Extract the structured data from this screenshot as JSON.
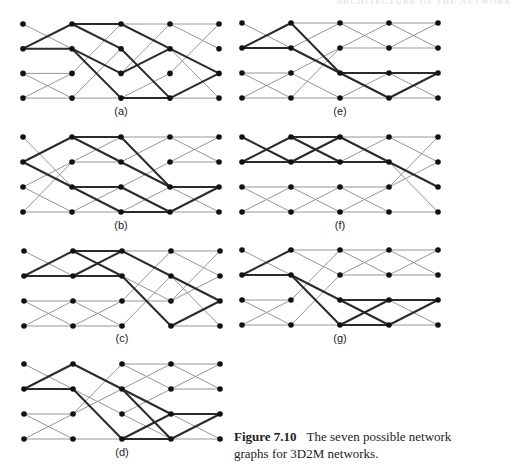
{
  "header": {
    "text": "ARCHITECTURE OF THE NETWORK"
  },
  "caption": {
    "figure_number": "Figure 7.10",
    "text": "The seven possible network graphs for 3D2M networks."
  },
  "style": {
    "node_color": "#111111",
    "thin_color": "#8a8a8a",
    "thick_color": "#2a2a2a"
  },
  "panels": [
    {
      "label": "(a)",
      "x0": 23,
      "y0": 24,
      "dx": 49,
      "dy": 24.7,
      "label_y": 115,
      "thin": [
        [
          0,
          0,
          0,
          0
        ],
        [
          0,
          0,
          1,
          1
        ],
        [
          0,
          2,
          1,
          2
        ],
        [
          0,
          2,
          1,
          3
        ],
        [
          0,
          3,
          1,
          2
        ],
        [
          0,
          3,
          1,
          3
        ],
        [
          1,
          2,
          2,
          0
        ],
        [
          1,
          3,
          2,
          1
        ],
        [
          1,
          3,
          2,
          3
        ],
        [
          2,
          0,
          3,
          0
        ],
        [
          2,
          2,
          3,
          0
        ],
        [
          2,
          3,
          3,
          2
        ],
        [
          3,
          0,
          4,
          0
        ],
        [
          3,
          0,
          4,
          1
        ],
        [
          3,
          1,
          4,
          3
        ],
        [
          3,
          2,
          4,
          0
        ],
        [
          3,
          3,
          4,
          3
        ]
      ],
      "thick": [
        [
          0,
          1,
          1,
          0
        ],
        [
          0,
          1,
          1,
          1
        ],
        [
          1,
          0,
          2,
          0
        ],
        [
          1,
          0,
          2,
          1
        ],
        [
          1,
          1,
          2,
          2
        ],
        [
          1,
          1,
          2,
          3
        ],
        [
          2,
          0,
          3,
          1
        ],
        [
          2,
          1,
          3,
          3
        ],
        [
          2,
          2,
          3,
          1
        ],
        [
          2,
          3,
          3,
          3
        ],
        [
          3,
          1,
          4,
          2
        ],
        [
          3,
          3,
          4,
          2
        ]
      ]
    },
    {
      "label": "(e)",
      "x0": 242,
      "y0": 23,
      "dx": 49,
      "dy": 25,
      "label_y": 115,
      "thin": [
        [
          0,
          0,
          0,
          0
        ],
        [
          0,
          0,
          1,
          1
        ],
        [
          0,
          2,
          1,
          2
        ],
        [
          0,
          2,
          1,
          3
        ],
        [
          0,
          3,
          1,
          2
        ],
        [
          0,
          3,
          1,
          3
        ],
        [
          1,
          0,
          2,
          0
        ],
        [
          1,
          1,
          2,
          0
        ],
        [
          1,
          2,
          2,
          1
        ],
        [
          1,
          3,
          2,
          3
        ],
        [
          1,
          3,
          2,
          1
        ],
        [
          1,
          2,
          2,
          3
        ],
        [
          2,
          0,
          3,
          0
        ],
        [
          2,
          0,
          3,
          1
        ],
        [
          2,
          1,
          3,
          1
        ],
        [
          2,
          1,
          3,
          0
        ],
        [
          2,
          2,
          3,
          2
        ],
        [
          2,
          3,
          3,
          2
        ],
        [
          2,
          3,
          3,
          3
        ],
        [
          3,
          0,
          4,
          0
        ],
        [
          3,
          0,
          4,
          1
        ],
        [
          3,
          1,
          4,
          1
        ],
        [
          3,
          1,
          4,
          0
        ],
        [
          3,
          2,
          4,
          3
        ],
        [
          3,
          3,
          4,
          3
        ]
      ],
      "thick": [
        [
          0,
          1,
          1,
          0
        ],
        [
          0,
          1,
          1,
          1
        ],
        [
          1,
          0,
          2,
          2
        ],
        [
          1,
          1,
          2,
          2
        ],
        [
          2,
          2,
          3,
          2
        ],
        [
          2,
          2,
          3,
          3
        ],
        [
          3,
          2,
          4,
          2
        ],
        [
          3,
          3,
          4,
          2
        ]
      ]
    },
    {
      "label": "(b)",
      "x0": 23,
      "y0": 137,
      "dx": 49,
      "dy": 25,
      "label_y": 229,
      "thin": [
        [
          0,
          0,
          0,
          0
        ],
        [
          0,
          0,
          1,
          2
        ],
        [
          0,
          2,
          1,
          1
        ],
        [
          0,
          2,
          1,
          3
        ],
        [
          0,
          3,
          1,
          1
        ],
        [
          0,
          3,
          1,
          3
        ],
        [
          1,
          1,
          2,
          1
        ],
        [
          1,
          1,
          2,
          0
        ],
        [
          1,
          3,
          2,
          2
        ],
        [
          1,
          3,
          2,
          3
        ],
        [
          2,
          0,
          3,
          0
        ],
        [
          2,
          1,
          3,
          0
        ],
        [
          2,
          2,
          3,
          1
        ],
        [
          2,
          3,
          3,
          2
        ],
        [
          3,
          0,
          4,
          0
        ],
        [
          3,
          0,
          4,
          1
        ],
        [
          3,
          1,
          4,
          0
        ],
        [
          3,
          1,
          4,
          1
        ],
        [
          3,
          2,
          4,
          3
        ],
        [
          3,
          3,
          4,
          3
        ]
      ],
      "thick": [
        [
          0,
          1,
          1,
          0
        ],
        [
          0,
          1,
          1,
          2
        ],
        [
          1,
          0,
          2,
          0
        ],
        [
          1,
          0,
          2,
          1
        ],
        [
          1,
          2,
          2,
          2
        ],
        [
          1,
          2,
          2,
          3
        ],
        [
          2,
          0,
          3,
          2
        ],
        [
          2,
          1,
          3,
          2
        ],
        [
          2,
          2,
          3,
          3
        ],
        [
          2,
          3,
          3,
          3
        ],
        [
          3,
          2,
          4,
          2
        ],
        [
          3,
          3,
          4,
          2
        ]
      ]
    },
    {
      "label": "(f)",
      "x0": 242,
      "y0": 137,
      "dx": 49,
      "dy": 25,
      "label_y": 229,
      "thin": [
        [
          0,
          0,
          0,
          0
        ],
        [
          0,
          2,
          1,
          2
        ],
        [
          0,
          2,
          1,
          3
        ],
        [
          0,
          3,
          1,
          2
        ],
        [
          0,
          3,
          1,
          3
        ],
        [
          1,
          2,
          2,
          2
        ],
        [
          1,
          2,
          2,
          3
        ],
        [
          1,
          3,
          2,
          2
        ],
        [
          1,
          3,
          2,
          3
        ],
        [
          2,
          0,
          3,
          0
        ],
        [
          2,
          1,
          3,
          0
        ],
        [
          2,
          2,
          3,
          2
        ],
        [
          2,
          2,
          3,
          3
        ],
        [
          2,
          3,
          3,
          2
        ],
        [
          2,
          3,
          3,
          3
        ],
        [
          3,
          0,
          4,
          0
        ],
        [
          3,
          0,
          4,
          1
        ],
        [
          3,
          1,
          4,
          3
        ],
        [
          3,
          2,
          4,
          0
        ],
        [
          3,
          2,
          4,
          1
        ],
        [
          3,
          3,
          4,
          3
        ]
      ],
      "thick": [
        [
          0,
          1,
          1,
          0
        ],
        [
          0,
          1,
          1,
          1
        ],
        [
          0,
          0,
          1,
          1
        ],
        [
          1,
          0,
          2,
          0
        ],
        [
          1,
          0,
          2,
          1
        ],
        [
          1,
          1,
          2,
          0
        ],
        [
          1,
          1,
          2,
          1
        ],
        [
          2,
          0,
          3,
          1
        ],
        [
          2,
          1,
          3,
          1
        ],
        [
          3,
          1,
          4,
          2
        ]
      ]
    },
    {
      "label": "(c)",
      "x0": 24,
      "y0": 251,
      "dx": 49,
      "dy": 25,
      "label_y": 342,
      "thin": [
        [
          0,
          0,
          0,
          0
        ],
        [
          0,
          0,
          1,
          1
        ],
        [
          0,
          2,
          1,
          2
        ],
        [
          0,
          2,
          1,
          3
        ],
        [
          0,
          3,
          1,
          2
        ],
        [
          0,
          3,
          1,
          3
        ],
        [
          1,
          2,
          2,
          2
        ],
        [
          1,
          2,
          2,
          3
        ],
        [
          1,
          3,
          2,
          2
        ],
        [
          1,
          3,
          2,
          3
        ],
        [
          2,
          0,
          3,
          0
        ],
        [
          2,
          1,
          3,
          2
        ],
        [
          2,
          2,
          3,
          0
        ],
        [
          2,
          2,
          3,
          2
        ],
        [
          2,
          3,
          3,
          1
        ],
        [
          3,
          0,
          4,
          0
        ],
        [
          3,
          0,
          4,
          1
        ],
        [
          3,
          1,
          4,
          3
        ],
        [
          3,
          2,
          4,
          0
        ],
        [
          3,
          2,
          4,
          1
        ],
        [
          3,
          3,
          4,
          3
        ]
      ],
      "thick": [
        [
          0,
          1,
          1,
          0
        ],
        [
          0,
          1,
          1,
          1
        ],
        [
          1,
          0,
          2,
          0
        ],
        [
          1,
          0,
          2,
          1
        ],
        [
          1,
          1,
          2,
          0
        ],
        [
          1,
          1,
          2,
          1
        ],
        [
          2,
          0,
          3,
          1
        ],
        [
          2,
          1,
          3,
          3
        ],
        [
          3,
          1,
          4,
          2
        ],
        [
          3,
          3,
          4,
          2
        ]
      ]
    },
    {
      "label": "(g)",
      "x0": 242,
      "y0": 250,
      "dx": 49,
      "dy": 25,
      "label_y": 342,
      "thin": [
        [
          0,
          0,
          0,
          0
        ],
        [
          0,
          0,
          1,
          1
        ],
        [
          0,
          2,
          1,
          2
        ],
        [
          0,
          2,
          1,
          3
        ],
        [
          0,
          3,
          1,
          2
        ],
        [
          0,
          3,
          1,
          3
        ],
        [
          1,
          0,
          2,
          0
        ],
        [
          1,
          0,
          2,
          1
        ],
        [
          1,
          2,
          2,
          0
        ],
        [
          1,
          3,
          2,
          1
        ],
        [
          1,
          3,
          2,
          3
        ],
        [
          2,
          0,
          3,
          0
        ],
        [
          2,
          0,
          3,
          1
        ],
        [
          2,
          1,
          3,
          0
        ],
        [
          2,
          1,
          3,
          1
        ],
        [
          2,
          3,
          3,
          3
        ],
        [
          3,
          0,
          4,
          0
        ],
        [
          3,
          0,
          4,
          1
        ],
        [
          3,
          1,
          4,
          0
        ],
        [
          3,
          1,
          4,
          1
        ],
        [
          3,
          2,
          4,
          3
        ],
        [
          3,
          3,
          4,
          3
        ]
      ],
      "thick": [
        [
          0,
          1,
          1,
          0
        ],
        [
          0,
          1,
          1,
          1
        ],
        [
          1,
          1,
          2,
          2
        ],
        [
          1,
          1,
          2,
          3
        ],
        [
          2,
          2,
          3,
          2
        ],
        [
          2,
          2,
          3,
          3
        ],
        [
          2,
          3,
          3,
          2
        ],
        [
          2,
          3,
          3,
          3
        ],
        [
          3,
          2,
          4,
          2
        ],
        [
          3,
          3,
          4,
          2
        ]
      ]
    },
    {
      "label": "(d)",
      "x0": 24,
      "y0": 364,
      "dx": 49,
      "dy": 25,
      "label_y": 456,
      "thin": [
        [
          0,
          0,
          0,
          0
        ],
        [
          0,
          0,
          1,
          1
        ],
        [
          0,
          2,
          1,
          2
        ],
        [
          0,
          2,
          1,
          3
        ],
        [
          0,
          3,
          1,
          2
        ],
        [
          0,
          3,
          1,
          3
        ],
        [
          1,
          0,
          2,
          1
        ],
        [
          1,
          2,
          2,
          0
        ],
        [
          1,
          2,
          2,
          1
        ],
        [
          1,
          3,
          2,
          3
        ],
        [
          1,
          1,
          2,
          2
        ],
        [
          2,
          0,
          3,
          0
        ],
        [
          2,
          0,
          3,
          1
        ],
        [
          2,
          1,
          3,
          0
        ],
        [
          2,
          2,
          3,
          1
        ],
        [
          2,
          2,
          3,
          3
        ],
        [
          3,
          0,
          4,
          0
        ],
        [
          3,
          0,
          4,
          1
        ],
        [
          3,
          1,
          4,
          0
        ],
        [
          3,
          1,
          4,
          1
        ],
        [
          3,
          2,
          4,
          3
        ],
        [
          3,
          3,
          4,
          3
        ]
      ],
      "thick": [
        [
          0,
          1,
          1,
          0
        ],
        [
          0,
          1,
          1,
          1
        ],
        [
          1,
          0,
          2,
          1
        ],
        [
          1,
          1,
          2,
          3
        ],
        [
          2,
          1,
          3,
          2
        ],
        [
          2,
          1,
          3,
          3
        ],
        [
          2,
          3,
          3,
          2
        ],
        [
          2,
          3,
          3,
          3
        ],
        [
          3,
          2,
          4,
          2
        ],
        [
          3,
          3,
          4,
          2
        ]
      ]
    }
  ]
}
